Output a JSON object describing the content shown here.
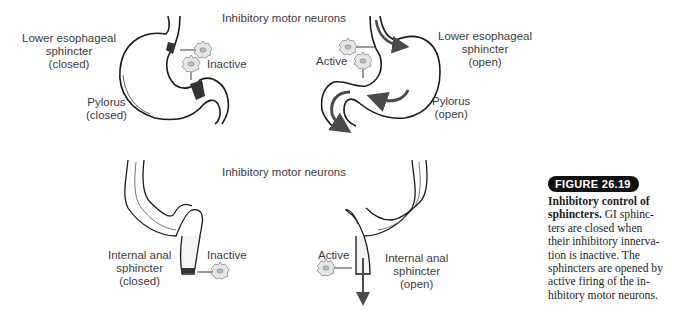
{
  "figure": {
    "badge": "FIGURE 26.19",
    "caption_title": "Inhibitory control of sphincters.",
    "caption_lines": [
      "GI sphinc-",
      "ters are closed when",
      "their inhibitory innerva-",
      "tion is inactive. The",
      "sphincters are opened by",
      "active firing of the in-",
      "hibitory motor neurons."
    ]
  },
  "top_panel": {
    "header": "Inhibitory motor neurons",
    "left": {
      "les_label": [
        "Lower esophageal",
        "sphincter",
        "(closed)"
      ],
      "pylorus_label": [
        "Pylorus",
        "(closed)"
      ],
      "neuron_state": "Inactive"
    },
    "right": {
      "les_label": [
        "Lower esophageal",
        "sphincter",
        "(open)"
      ],
      "pylorus_label": [
        "Pylorus",
        "(open)"
      ],
      "neuron_state": "Active"
    }
  },
  "bottom_panel": {
    "header": "Inhibitory motor neurons",
    "left": {
      "sphincter_label": [
        "Internal anal",
        "sphincter",
        "(closed)"
      ],
      "neuron_state": "Inactive"
    },
    "right": {
      "sphincter_label": [
        "Internal anal",
        "sphincter",
        "(open)"
      ],
      "neuron_state": "Active"
    }
  },
  "colors": {
    "outline": "#1a1a1a",
    "sphincter_fill": "#333333",
    "neuron_inactive": "#9a9a9a",
    "neuron_active": "#b8b8b8",
    "arrow": "#4a4a4a",
    "badge_bg": "#111111"
  }
}
